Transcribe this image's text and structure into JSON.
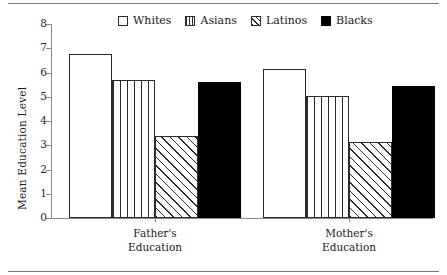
{
  "chart_data": {
    "type": "bar",
    "title": "",
    "subtitle": "",
    "xlabel": "",
    "ylabel": "Mean Education Level",
    "ylim": [
      0,
      8
    ],
    "yticks": [
      0,
      1,
      2,
      3,
      4,
      5,
      6,
      7,
      8
    ],
    "ytick_labels": [
      "0",
      "1",
      "2",
      "3",
      "4",
      "5",
      "6",
      "7",
      "8"
    ],
    "grid": false,
    "legend_position": "top-center",
    "categories": [
      "Father's Education",
      "Mother's Education"
    ],
    "category_lines": [
      [
        "Father's",
        "Education"
      ],
      [
        "Mother's",
        "Education"
      ]
    ],
    "series": [
      {
        "name": "Whites",
        "fill": "white",
        "values": [
          6.75,
          6.15
        ]
      },
      {
        "name": "Asians",
        "fill": "vlines",
        "values": [
          5.7,
          5.05
        ]
      },
      {
        "name": "Latinos",
        "fill": "diag",
        "values": [
          3.4,
          3.15
        ]
      },
      {
        "name": "Blacks",
        "fill": "black",
        "values": [
          5.6,
          5.45
        ]
      }
    ]
  },
  "legend": {
    "items": [
      {
        "label": "Whites",
        "fill": "white"
      },
      {
        "label": "Asians",
        "fill": "vlines"
      },
      {
        "label": "Latinos",
        "fill": "diag"
      },
      {
        "label": "Blacks",
        "fill": "black"
      }
    ]
  },
  "axis": {
    "y_title": "Mean Education Level"
  },
  "colors": {
    "foreground": "#1a1a1a",
    "axis": "#8a8a8a",
    "bar_outline": "#2b2b2b",
    "bar_solid": "#000000",
    "background": "#ffffff"
  }
}
